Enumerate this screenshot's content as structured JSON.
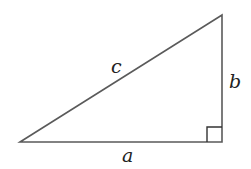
{
  "diagram": {
    "type": "right-triangle",
    "labels": {
      "hypotenuse": "c",
      "vertical_leg": "b",
      "horizontal_leg": "a"
    },
    "right_angle_marker": true,
    "stroke_color": "#5a5a5a"
  }
}
